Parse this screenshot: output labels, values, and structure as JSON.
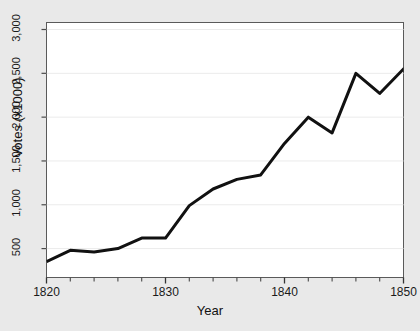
{
  "chart_data": {
    "type": "line",
    "title": "",
    "xlabel": "Year",
    "ylabel": "Votes (x1000)",
    "xlim": [
      1820,
      1850
    ],
    "ylim": [
      170,
      3080
    ],
    "grid": true,
    "grid_axis": "y",
    "legend": null,
    "line_color": "#111111",
    "line_width": 3,
    "background": "#e9e9e9",
    "plot_background": "#ffffff",
    "x_major_ticks": [
      1820,
      1830,
      1840,
      1850
    ],
    "x_major_tick_labels": [
      "1820",
      "1830",
      "1840",
      "1850"
    ],
    "x_minor_ticks": [
      1822,
      1824,
      1826,
      1828,
      1832,
      1834,
      1836,
      1838,
      1842,
      1844,
      1846,
      1848
    ],
    "y_ticks": [
      500,
      1000,
      1500,
      2000,
      2500,
      3000
    ],
    "y_tick_labels": [
      "500",
      "1,000",
      "1,500",
      "2,000",
      "2,500",
      "3,000"
    ],
    "x": [
      1820,
      1822,
      1824,
      1826,
      1828,
      1830,
      1832,
      1834,
      1836,
      1838,
      1840,
      1842,
      1844,
      1846,
      1848,
      1850
    ],
    "values": [
      350,
      480,
      460,
      500,
      620,
      620,
      990,
      1180,
      1290,
      1340,
      1700,
      2000,
      1820,
      2500,
      2270,
      2550
    ],
    "series": [
      {
        "name": "Votes",
        "values": [
          350,
          480,
          460,
          500,
          620,
          620,
          990,
          1180,
          1290,
          1340,
          1700,
          2000,
          1820,
          2500,
          2270,
          2550
        ]
      }
    ],
    "end_segment": {
      "x": 1851,
      "value": 2320,
      "note": "line continues past last major tick to plot edge"
    }
  }
}
